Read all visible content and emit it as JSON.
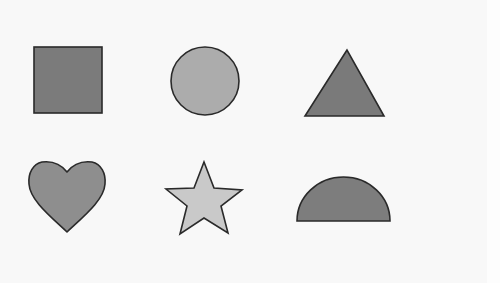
{
  "canvas": {
    "background": "#f8f8f8",
    "width": 500,
    "height": 283
  },
  "shapes": [
    {
      "name": "square",
      "fill": "#7b7b7b",
      "stroke": "#2a2a2a",
      "row": 1,
      "col": 1
    },
    {
      "name": "circle",
      "fill": "#acacac",
      "stroke": "#2a2a2a",
      "row": 1,
      "col": 2
    },
    {
      "name": "triangle",
      "fill": "#7a7a7a",
      "stroke": "#2a2a2a",
      "row": 1,
      "col": 3
    },
    {
      "name": "heart",
      "fill": "#8e8e8e",
      "stroke": "#2a2a2a",
      "row": 2,
      "col": 1
    },
    {
      "name": "star",
      "fill": "#c9c9c9",
      "stroke": "#2a2a2a",
      "row": 2,
      "col": 2
    },
    {
      "name": "semicircle",
      "fill": "#7d7d7d",
      "stroke": "#2a2a2a",
      "row": 2,
      "col": 3
    }
  ]
}
